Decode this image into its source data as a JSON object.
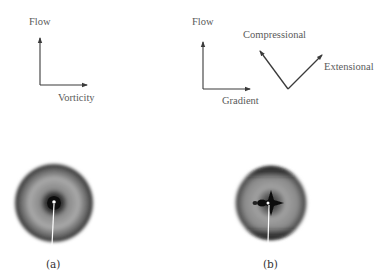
{
  "panel_a": {
    "axes": {
      "vertical_label": "Flow",
      "horizontal_label": "Vorticity"
    },
    "pattern": "isotropic-ring-diffraction",
    "caption": "(a)"
  },
  "panel_b": {
    "axes": {
      "vertical_label": "Flow",
      "horizontal_label": "Gradient"
    },
    "principal_axes": {
      "compressional_label": "Compressional",
      "extensional_label": "Extensional"
    },
    "pattern": "anisotropic-cross-diffraction",
    "caption": "(b)"
  },
  "colors": {
    "line": "#3a3a3a",
    "text": "#5a5a5a",
    "pattern_dark": "#2a2a2a",
    "pattern_mid": "#9a9a9a"
  }
}
